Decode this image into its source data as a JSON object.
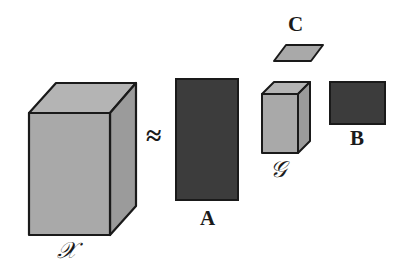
{
  "figure": {
    "equation_symbol": "≈",
    "colors": {
      "light_fill": "#a9a9a9",
      "light_fill_top": "#b4b4b4",
      "light_fill_side": "#9b9b9b",
      "dark_fill": "#3c3c3c",
      "dark_fill_top": "#474747",
      "dark_fill_side": "#333333",
      "outline": "#1a1a1a",
      "background": "#ffffff",
      "text": "#1a1a1a"
    }
  },
  "objects": {
    "tensor_x": {
      "label": "𝒳",
      "kind": "cuboid",
      "shade": "light",
      "geometry": {
        "front": "29,113 110,113 110,235 29,235",
        "top": "29,113 56,83 136,83 110,113",
        "side": "110,113 136,83 136,206 110,235"
      }
    },
    "factor_a": {
      "label": "A",
      "kind": "rectangle",
      "shade": "dark",
      "geometry": {
        "x": 176,
        "y": 79,
        "width": 62,
        "height": 121
      }
    },
    "core_g": {
      "label": "𝒢",
      "kind": "cuboid",
      "shade": "light",
      "geometry": {
        "front": "262,94 298,94 298,153 262,153",
        "top": "262,94 274,82 310,82 298,94",
        "side": "298,94 310,82 310,141 298,153"
      }
    },
    "factor_b": {
      "label": "B",
      "kind": "rectangle",
      "shade": "dark",
      "geometry": {
        "x": 330,
        "y": 82,
        "width": 55,
        "height": 42
      }
    },
    "factor_c": {
      "label": "C",
      "kind": "parallelogram",
      "shade": "light",
      "geometry": {
        "points": "286,45 323,45 311,61 274,61"
      }
    }
  }
}
